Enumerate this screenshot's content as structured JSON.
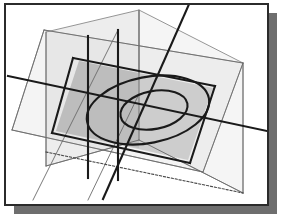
{
  "figure": {
    "type": "technical-line-diagram",
    "canvas": {
      "width": 287,
      "height": 222
    }
  },
  "colors": {
    "background": "#ffffff",
    "frame_border": "#2b2b2b",
    "drop_shadow": "#6e6e6e",
    "plane_light_fill": "#f2f2f2",
    "plane_light_stroke": "#8a8a8a",
    "plane_medium_fill": "#c9c9c9",
    "plane_medium_stroke": "#7d7d7d",
    "plane_dark_fill": "#b0b0b0",
    "plane_vertical_fill": "#d8d8d8",
    "ellipse_stroke": "#1a1a1a",
    "heavy_line": "#1a1a1a",
    "thin_line": "#6b6b6b",
    "dotted_line": "#4a4a4a"
  },
  "frame": {
    "name": "outer-frame",
    "x": 5,
    "y": 4,
    "width": 263,
    "height": 201,
    "stroke_width": 2,
    "shadow_offset_x": 9,
    "shadow_offset_y": 9
  },
  "geometry": {
    "light_plane": {
      "label": "large pale horizontal plane",
      "points": "44,30 243,63 203,172 12,130"
    },
    "base_plane": {
      "label": "shaded base quadrilateral",
      "points": "73,58 215,86 190,163 52,133"
    },
    "shaded_plane": {
      "label": "medium gray tilted plane with ellipses",
      "points": "79,61 213,88 188,160 56,131"
    },
    "vertical_plane_left": {
      "label": "left vertical cutting plane",
      "points": "46,32 139,10 139,140 46,166"
    },
    "vertical_plane_right": {
      "label": "right vertical cutting plane",
      "points": "139,10 243,63 243,193 139,140"
    },
    "outer_ellipse": {
      "label": "outer ellipse",
      "cx": 148,
      "cy": 110,
      "rx": 62,
      "ry": 33,
      "rotation": -11
    },
    "inner_ellipse": {
      "label": "inner ellipse",
      "cx": 154,
      "cy": 110,
      "rx": 34,
      "ry": 19,
      "rotation": -11
    },
    "heavy_lines": [
      {
        "label": "long traversing chord left to right",
        "x1": 8,
        "y1": 76,
        "x2": 281,
        "y2": 134
      },
      {
        "label": "base plane top edge",
        "x1": 73,
        "y1": 58,
        "x2": 215,
        "y2": 86
      },
      {
        "label": "base plane left edge",
        "x1": 73,
        "y1": 58,
        "x2": 52,
        "y2": 133
      },
      {
        "label": "base plane bottom edge",
        "x1": 52,
        "y1": 133,
        "x2": 190,
        "y2": 163
      },
      {
        "label": "base plane right edge",
        "x1": 215,
        "y1": 86,
        "x2": 190,
        "y2": 163
      },
      {
        "label": "steep diagonal through ellipses",
        "x1": 103,
        "y1": 199,
        "x2": 190,
        "y2": 2
      },
      {
        "label": "vertical trace left",
        "x1": 88,
        "y1": 36,
        "x2": 88,
        "y2": 178
      },
      {
        "label": "vertical trace mid",
        "x1": 118,
        "y1": 30,
        "x2": 118,
        "y2": 180
      }
    ],
    "thin_lines": [
      {
        "label": "light plane left edge",
        "x1": 44,
        "y1": 30,
        "x2": 12,
        "y2": 130
      },
      {
        "label": "light plane top edge",
        "x1": 44,
        "y1": 30,
        "x2": 243,
        "y2": 63
      },
      {
        "label": "light plane right edge",
        "x1": 243,
        "y1": 63,
        "x2": 203,
        "y2": 172
      },
      {
        "label": "light plane bottom edge",
        "x1": 12,
        "y1": 130,
        "x2": 203,
        "y2": 172
      },
      {
        "label": "vertical left plane near edge",
        "x1": 46,
        "y1": 32,
        "x2": 46,
        "y2": 166
      },
      {
        "label": "vertical left plane far edge",
        "x1": 139,
        "y1": 10,
        "x2": 139,
        "y2": 140
      },
      {
        "label": "vertical right plane far edge",
        "x1": 243,
        "y1": 63,
        "x2": 243,
        "y2": 193
      },
      {
        "label": "vertical plane lower diagonal left",
        "x1": 46,
        "y1": 166,
        "x2": 139,
        "y2": 140
      },
      {
        "label": "vertical plane lower diagonal right",
        "x1": 139,
        "y1": 140,
        "x2": 243,
        "y2": 193
      },
      {
        "label": "oblique ray lower left",
        "x1": 33,
        "y1": 200,
        "x2": 118,
        "y2": 30
      },
      {
        "label": "oblique ray bottom",
        "x1": 88,
        "y1": 200,
        "x2": 139,
        "y2": 94
      },
      {
        "label": "frame diagonal upper right",
        "x1": 190,
        "y1": 2,
        "x2": 152,
        "y2": 88
      }
    ],
    "dotted_lines": [
      {
        "label": "hidden bottom trace",
        "x1": 46,
        "y1": 152,
        "x2": 243,
        "y2": 193
      }
    ]
  }
}
